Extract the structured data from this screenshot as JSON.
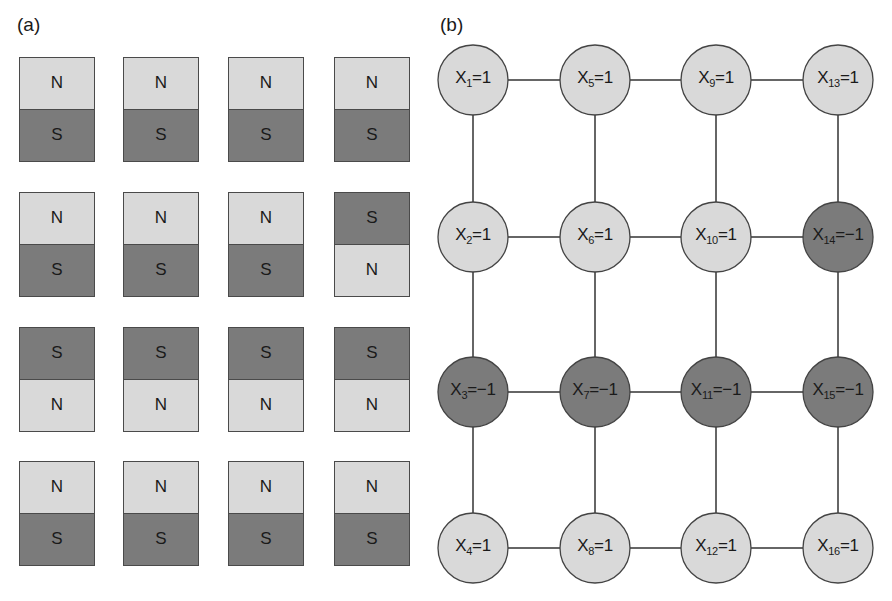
{
  "panel_a": {
    "label": "(a)",
    "colors": {
      "N": "#d9d9d9",
      "S": "#7b7b7b"
    },
    "magnets": [
      [
        {
          "top": "N",
          "bottom": "S"
        },
        {
          "top": "N",
          "bottom": "S"
        },
        {
          "top": "N",
          "bottom": "S"
        },
        {
          "top": "N",
          "bottom": "S"
        }
      ],
      [
        {
          "top": "N",
          "bottom": "S"
        },
        {
          "top": "N",
          "bottom": "S"
        },
        {
          "top": "N",
          "bottom": "S"
        },
        {
          "top": "S",
          "bottom": "N"
        }
      ],
      [
        {
          "top": "S",
          "bottom": "N"
        },
        {
          "top": "S",
          "bottom": "N"
        },
        {
          "top": "S",
          "bottom": "N"
        },
        {
          "top": "S",
          "bottom": "N"
        }
      ],
      [
        {
          "top": "N",
          "bottom": "S"
        },
        {
          "top": "N",
          "bottom": "S"
        },
        {
          "top": "N",
          "bottom": "S"
        },
        {
          "top": "N",
          "bottom": "S"
        }
      ]
    ]
  },
  "panel_b": {
    "label": "(b)",
    "colors": {
      "positive": "#d9d9d9",
      "negative": "#7b7b7b"
    },
    "nodes": [
      {
        "var": "X",
        "index": "1",
        "value": "1"
      },
      {
        "var": "X",
        "index": "2",
        "value": "1"
      },
      {
        "var": "X",
        "index": "3",
        "value": "−1"
      },
      {
        "var": "X",
        "index": "4",
        "value": "1"
      },
      {
        "var": "X",
        "index": "5",
        "value": "1"
      },
      {
        "var": "X",
        "index": "6",
        "value": "1"
      },
      {
        "var": "X",
        "index": "7",
        "value": "−1"
      },
      {
        "var": "X",
        "index": "8",
        "value": "1"
      },
      {
        "var": "X",
        "index": "9",
        "value": "1"
      },
      {
        "var": "X",
        "index": "10",
        "value": "1"
      },
      {
        "var": "X",
        "index": "11",
        "value": "−1"
      },
      {
        "var": "X",
        "index": "12",
        "value": "1"
      },
      {
        "var": "X",
        "index": "13",
        "value": "1"
      },
      {
        "var": "X",
        "index": "14",
        "value": "−1"
      },
      {
        "var": "X",
        "index": "15",
        "value": "−1"
      },
      {
        "var": "X",
        "index": "16",
        "value": "1"
      }
    ]
  }
}
